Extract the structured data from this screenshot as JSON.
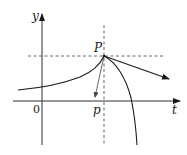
{
  "diagram": {
    "type": "function-plot-with-tangent",
    "labels": {
      "y_axis": "y",
      "x_axis": "t",
      "origin": "0",
      "point": "P",
      "x_tick": "p"
    },
    "colors": {
      "stroke": "#1a1a1a",
      "dashed": "#555555",
      "background": "#ffffff"
    },
    "elements": [
      "y-axis with arrow",
      "t-axis with arrow",
      "horizontal dashed line through P",
      "vertical dashed line through P at t = p",
      "left curve increasing to cusp at P",
      "right curve decreasing steeply from P",
      "tangent arrow from P pointing down-right",
      "short arrow from P pointing down-left"
    ]
  }
}
